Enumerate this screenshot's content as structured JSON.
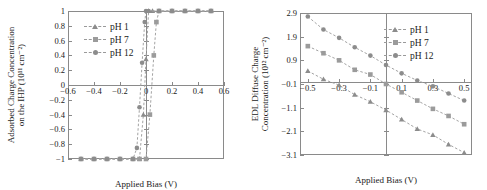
{
  "figure": {
    "panels": [
      "left",
      "right"
    ]
  },
  "chart_data": [
    {
      "id": "adsorbed-charge",
      "type": "line",
      "title": "",
      "xlabel": "Applied Bias (V)",
      "ylabel_line1": "Adsorbed Charge Concentration",
      "ylabel_line2": "on the IHP (10¹¹ cm⁻²)",
      "ylabel_plain": "Adsorbed Charge Concentration on the IHP (10^11 cm^-2)",
      "xlim": [
        -0.6,
        0.6
      ],
      "ylim": [
        -1.0,
        1.0
      ],
      "xticks": [
        -0.6,
        -0.4,
        -0.2,
        0,
        0.2,
        0.4,
        0.6
      ],
      "xticklabels": [
        "−0.6",
        "−0.4",
        "−0.2",
        "0",
        "0.2",
        "0.4",
        "0.6"
      ],
      "yticks": [
        -1,
        -0.8,
        -0.6,
        -0.4,
        -0.2,
        0,
        0.2,
        0.4,
        0.6,
        0.8,
        1
      ],
      "yticklabels": [
        "−1",
        "−0.8",
        "−0.6",
        "−0.4",
        "−0.2",
        "0",
        "0.2",
        "0.4",
        "0.6",
        "0.8",
        "1"
      ],
      "grid": false,
      "legend_position": "upper-left",
      "series": [
        {
          "name": "pH 1",
          "marker": "triangle",
          "color": "#8c8c8c",
          "x": [
            -0.5,
            -0.4,
            -0.3,
            -0.2,
            -0.1,
            -0.05,
            -0.02,
            0.0,
            0.02,
            0.05,
            0.1,
            0.2,
            0.3,
            0.4,
            0.5
          ],
          "y": [
            -1,
            -1,
            -1,
            -1,
            -1,
            -1,
            -0.4,
            0.35,
            1,
            1,
            1,
            1,
            1,
            1,
            1
          ]
        },
        {
          "name": "pH 7",
          "marker": "square",
          "color": "#9b9b9b",
          "x": [
            -0.5,
            -0.4,
            -0.3,
            -0.2,
            -0.1,
            -0.05,
            0.0,
            0.03,
            0.06,
            0.08,
            0.1,
            0.2,
            0.3,
            0.4,
            0.5
          ],
          "y": [
            -1,
            -1,
            -1,
            -1,
            -1,
            -1,
            -1,
            -0.4,
            0.4,
            0.85,
            1,
            1,
            1,
            1,
            1
          ]
        },
        {
          "name": "pH 12",
          "marker": "circle",
          "color": "#8c8c8c",
          "x": [
            -0.5,
            -0.4,
            -0.3,
            -0.2,
            -0.1,
            -0.07,
            -0.05,
            -0.03,
            -0.01,
            0.0,
            0.02,
            0.1,
            0.2,
            0.3,
            0.4,
            0.5
          ],
          "y": [
            -1,
            -1,
            -1,
            -1,
            -1,
            -0.85,
            -0.3,
            0.3,
            0.85,
            1,
            1,
            1,
            1,
            1,
            1,
            1
          ]
        }
      ]
    },
    {
      "id": "edl-diffuse-charge",
      "type": "line",
      "title": "",
      "xlabel": "Applied Bias (V)",
      "ylabel_line1": "EDL Diffuse Charge",
      "ylabel_line2": "Concentration (10¹² cm⁻²)",
      "ylabel_plain": "EDL Diffuse Charge Concentration (10^12 cm^-2)",
      "xlim": [
        -0.55,
        0.55
      ],
      "ylim": [
        -3.1,
        2.9
      ],
      "xticks": [
        -0.5,
        -0.3,
        -0.1,
        0.1,
        0.3,
        0.5
      ],
      "xticklabels": [
        "−0.5",
        "−0.3",
        "−0.1",
        "0.1",
        "0.3",
        "0.5"
      ],
      "yticks": [
        2.9,
        1.9,
        0.9,
        -0.1,
        -1.1,
        -2.1,
        -3.1
      ],
      "yticklabels": [
        "2.9",
        "1.9",
        "0.9",
        "−0.1",
        "−1.1",
        "−2.1",
        "−3.1"
      ],
      "grid": false,
      "legend_position": "upper-right",
      "series": [
        {
          "name": "pH 1",
          "marker": "triangle",
          "color": "#8c8c8c",
          "x": [
            -0.5,
            -0.4,
            -0.3,
            -0.2,
            -0.1,
            0.0,
            0.1,
            0.2,
            0.3,
            0.4,
            0.5
          ],
          "y": [
            0.45,
            0.1,
            -0.15,
            -0.55,
            -0.85,
            -1.2,
            -1.6,
            -2.0,
            -2.25,
            -2.65,
            -3.0
          ]
        },
        {
          "name": "pH 7",
          "marker": "square",
          "color": "#9b9b9b",
          "x": [
            -0.5,
            -0.4,
            -0.3,
            -0.2,
            -0.1,
            0.0,
            0.1,
            0.2,
            0.3,
            0.4,
            0.5
          ],
          "y": [
            1.5,
            1.2,
            0.9,
            0.5,
            0.3,
            -0.1,
            -0.45,
            -0.8,
            -1.15,
            -1.45,
            -1.8
          ]
        },
        {
          "name": "pH 12",
          "marker": "circle",
          "color": "#8c8c8c",
          "x": [
            -0.5,
            -0.4,
            -0.3,
            -0.2,
            -0.1,
            0.0,
            0.1,
            0.2,
            0.3,
            0.4,
            0.5
          ],
          "y": [
            2.75,
            2.2,
            1.85,
            1.45,
            1.1,
            0.7,
            0.35,
            0.05,
            -0.2,
            -0.5,
            -0.8
          ]
        }
      ]
    }
  ]
}
